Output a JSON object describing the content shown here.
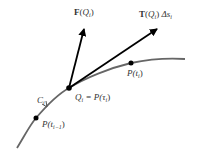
{
  "diagram": {
    "curve_label": {
      "main": "C",
      "sub": "i"
    },
    "force_label": {
      "func": "F",
      "arg": "Q",
      "sub": "i"
    },
    "tangent_label": {
      "func": "T",
      "arg": "Q",
      "sub": "i",
      "suffix": "Δs",
      "suffix_sub": "i"
    },
    "q_label": {
      "main": "Q",
      "sub": "i",
      "eq": " = P(τ",
      "eq_sub": "i",
      "close": ")"
    },
    "p_ti_label": {
      "main": "P(t",
      "sub": "i",
      "close": ")"
    },
    "p_tim1_label": {
      "main": "P(t",
      "sub": "i−1",
      "close": ")"
    },
    "colors": {
      "curve": "#666666",
      "arrow": "#000000",
      "text": "#333333"
    }
  }
}
